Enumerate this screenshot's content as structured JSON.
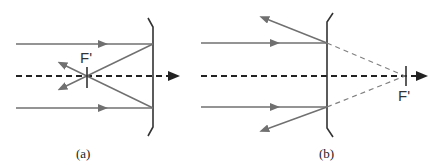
{
  "figure": {
    "panels": [
      {
        "id": "a",
        "caption": "(a)",
        "focal_label": "F'",
        "lens_type": "diverging"
      },
      {
        "id": "b",
        "caption": "(b)",
        "focal_label": "F'",
        "lens_type": "diverging"
      }
    ],
    "colors": {
      "ray": "#707070",
      "axis": "#222222",
      "lens": "#333333"
    }
  }
}
